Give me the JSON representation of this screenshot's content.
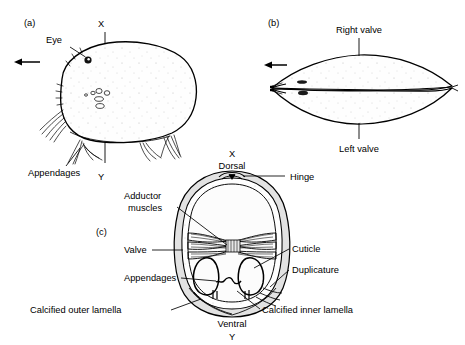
{
  "figure": {
    "background_color": "#ffffff",
    "ink_color": "#000000",
    "shell_fill_color": "#fdfdfd",
    "stipple_color": "#b8b8b8"
  },
  "panels": [
    {
      "id": "a",
      "tag": "(a)",
      "view": "lateral view of whole animal",
      "labels": {
        "eye": "Eye",
        "appendages": "Appendages",
        "section_top": "X",
        "section_bottom": "Y"
      }
    },
    {
      "id": "b",
      "tag": "(b)",
      "view": "dorsal view of carapace",
      "labels": {
        "right_valve": "Right valve",
        "left_valve": "Left valve"
      }
    },
    {
      "id": "c",
      "tag": "(c)",
      "view": "transverse section along X-Y",
      "labels": {
        "section_top": "X",
        "dorsal": "Dorsal",
        "hinge": "Hinge",
        "adductor_muscles_line1": "Adductor",
        "adductor_muscles_line2": "muscles",
        "valve": "Valve",
        "appendages": "Appendages",
        "cuticle": "Cuticle",
        "duplicature": "Duplicature",
        "calcified_outer_lamella": "Calcified outer lamella",
        "calcified_inner_lamella": "Calcified inner lamella",
        "ventral": "Ventral",
        "section_bottom": "Y"
      }
    }
  ],
  "icons": {
    "anterior_arrow_a": "left-arrow-icon",
    "anterior_arrow_b": "left-arrow-icon"
  }
}
